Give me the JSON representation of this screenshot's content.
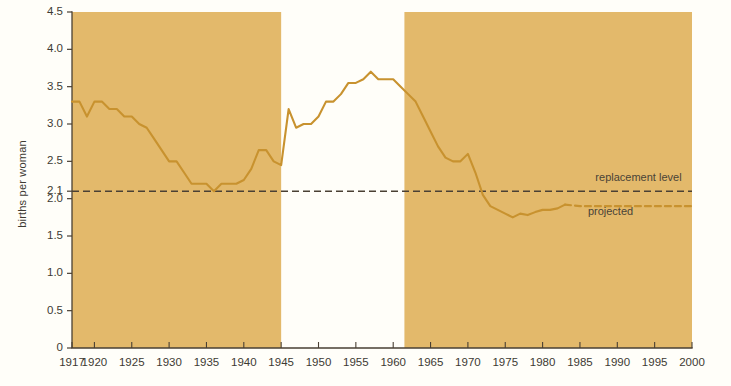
{
  "chart_data": {
    "type": "line",
    "title": "",
    "subtitle": "",
    "xlabel": "",
    "ylabel": "births per woman",
    "xlim": [
      1917,
      2000
    ],
    "ylim": [
      0,
      4.5
    ],
    "grid": false,
    "legend_position": "inline-annotations",
    "ytick_labels": [
      "0",
      "0.5",
      "1.0",
      "1.5",
      "2.0",
      "2.1",
      "2.5",
      "3.0",
      "3.5",
      "4.0",
      "4.5"
    ],
    "ytick_values": [
      0,
      0.5,
      1.0,
      1.5,
      2.0,
      2.1,
      2.5,
      3.0,
      3.5,
      4.0,
      4.5
    ],
    "xtick_labels": [
      "1917",
      "1920",
      "1925",
      "1930",
      "1935",
      "1940",
      "1945",
      "1950",
      "1955",
      "1960",
      "1965",
      "1970",
      "1975",
      "1980",
      "1985",
      "1990",
      "1995",
      "2000"
    ],
    "xtick_values": [
      1917,
      1920,
      1925,
      1930,
      1935,
      1940,
      1945,
      1950,
      1955,
      1960,
      1965,
      1970,
      1975,
      1980,
      1985,
      1990,
      1995,
      2000
    ],
    "annotations": [
      {
        "name": "replacement-level",
        "text": "replacement level",
        "x": 1988,
        "y": 2.28
      },
      {
        "name": "projected",
        "text": "projected",
        "x": 1987,
        "y": 1.82
      }
    ],
    "reference_lines": [
      {
        "name": "replacement-level-line",
        "value": 2.1,
        "style": "dashed",
        "color": "#4a4034"
      }
    ],
    "shaded_bands": [
      {
        "name": "band-1917-1945",
        "from": 1917,
        "to": 1945,
        "color": "#e3b96b"
      },
      {
        "name": "band-1961-2000",
        "from": 1961.5,
        "to": 2000,
        "color": "#e3b96b"
      }
    ],
    "line_color": "#c8922f",
    "series": [
      {
        "name": "total fertility rate",
        "style": "solid",
        "x": [
          1917,
          1918,
          1919,
          1920,
          1921,
          1922,
          1923,
          1924,
          1925,
          1926,
          1927,
          1928,
          1929,
          1930,
          1931,
          1932,
          1933,
          1934,
          1935,
          1936,
          1937,
          1938,
          1939,
          1940,
          1941,
          1942,
          1943,
          1944,
          1945,
          1946,
          1947,
          1948,
          1949,
          1950,
          1951,
          1952,
          1953,
          1954,
          1955,
          1956,
          1957,
          1958,
          1959,
          1960,
          1961,
          1962,
          1963,
          1964,
          1965,
          1966,
          1967,
          1968,
          1969,
          1970,
          1971,
          1972,
          1973,
          1974,
          1975,
          1976,
          1977,
          1978,
          1979,
          1980,
          1981,
          1982,
          1983
        ],
        "y": [
          3.3,
          3.3,
          3.1,
          3.3,
          3.3,
          3.2,
          3.2,
          3.1,
          3.1,
          3.0,
          2.95,
          2.8,
          2.65,
          2.5,
          2.5,
          2.35,
          2.2,
          2.2,
          2.2,
          2.1,
          2.2,
          2.2,
          2.2,
          2.25,
          2.4,
          2.65,
          2.65,
          2.5,
          2.45,
          3.2,
          2.95,
          3.0,
          3.0,
          3.1,
          3.3,
          3.3,
          3.4,
          3.55,
          3.55,
          3.6,
          3.7,
          3.6,
          3.6,
          3.6,
          3.5,
          3.4,
          3.3,
          3.1,
          2.9,
          2.7,
          2.55,
          2.5,
          2.5,
          2.6,
          2.35,
          2.05,
          1.9,
          1.85,
          1.8,
          1.75,
          1.8,
          1.78,
          1.82,
          1.85,
          1.85,
          1.87,
          1.92
        ]
      },
      {
        "name": "projected fertility rate",
        "style": "dashed",
        "x": [
          1983,
          1985,
          1990,
          1995,
          2000
        ],
        "y": [
          1.92,
          1.9,
          1.9,
          1.9,
          1.9
        ]
      }
    ]
  }
}
